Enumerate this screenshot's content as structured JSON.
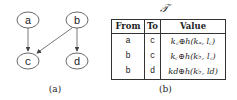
{
  "graph": {
    "nodes": [
      {
        "id": "a",
        "label": "a"
      },
      {
        "id": "b",
        "label": "b"
      },
      {
        "id": "c",
        "label": "c"
      },
      {
        "id": "d",
        "label": "d"
      }
    ],
    "edges": [
      {
        "from": "a",
        "to": "c"
      },
      {
        "from": "b",
        "to": "c"
      },
      {
        "from": "b",
        "to": "d"
      }
    ],
    "caption": "(a)"
  },
  "table": {
    "title": "𝒯",
    "headers": [
      "From",
      "To",
      "Value"
    ],
    "rows": [
      {
        "from": "a",
        "to": "c",
        "value": "k꜀⊕h(kₐ, l꜀)"
      },
      {
        "from": "b",
        "to": "c",
        "value": "k꜀⊕h(k♭, l꜀)"
      },
      {
        "from": "b",
        "to": "d",
        "value": "kd⊕h(k♭, ld)"
      }
    ],
    "caption": "(b)"
  }
}
